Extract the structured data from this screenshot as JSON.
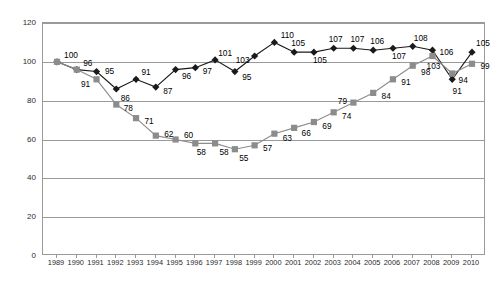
{
  "chart_data": {
    "type": "line",
    "title": "",
    "subtitle": "",
    "xlabel": "",
    "ylabel": "",
    "ylim": [
      0,
      120
    ],
    "yticks": [
      0,
      20,
      40,
      60,
      80,
      100,
      120
    ],
    "grid": true,
    "legend": "none",
    "categories": [
      "1989",
      "1990",
      "1991",
      "1992",
      "1993",
      "1994",
      "1995",
      "1996",
      "1997",
      "1998",
      "1999",
      "2000",
      "2001",
      "2002",
      "2003",
      "2004",
      "2005",
      "2006",
      "2007",
      "2008",
      "2009",
      "2010"
    ],
    "series": [
      {
        "name": "black-diamond-series",
        "marker": "diamond",
        "color": "#1a1a1a",
        "values": [
          100,
          96,
          95,
          86,
          91,
          87,
          96,
          97,
          101,
          95,
          103,
          110,
          105,
          105,
          107,
          107,
          106,
          107,
          108,
          106,
          91,
          105
        ],
        "labels": [
          "",
          "",
          "95",
          "86",
          "91",
          "87",
          "96",
          "97",
          "101",
          "95",
          "103",
          "110",
          "105",
          "105",
          "107",
          "107",
          "106",
          "107",
          "108",
          "106",
          "91",
          "105"
        ]
      },
      {
        "name": "gray-square-series",
        "marker": "square",
        "color": "#8c8c8c",
        "values": [
          100,
          96,
          91,
          78,
          71,
          62,
          60,
          58,
          58,
          55,
          57,
          63,
          66,
          69,
          74,
          79,
          84,
          91,
          98,
          103,
          94,
          99
        ],
        "labels": [
          "100",
          "96",
          "91",
          "78",
          "71",
          "62",
          "60",
          "58",
          "58",
          "55",
          "57",
          "63",
          "66",
          "69",
          "74",
          "79",
          "84",
          "91",
          "98",
          "103",
          "94",
          "99"
        ]
      }
    ]
  },
  "axis": {
    "y_tick_labels": [
      "0",
      "20",
      "40",
      "60",
      "80",
      "100",
      "120"
    ],
    "x_tick_labels": [
      "1989",
      "1990",
      "1991",
      "1992",
      "1993",
      "1994",
      "1995",
      "1996",
      "1997",
      "1998",
      "1999",
      "2000",
      "2001",
      "2002",
      "2003",
      "2004",
      "2005",
      "2006",
      "2007",
      "2008",
      "2009",
      "2010"
    ]
  },
  "style": {
    "black_series_color": "#1a1a1a",
    "gray_series_color": "#8c8c8c",
    "gridline_color": "#9a9a9a",
    "background": "#ffffff"
  }
}
